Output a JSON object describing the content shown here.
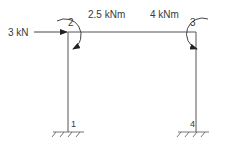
{
  "diagram": {
    "type": "portal-frame",
    "nodes": [
      {
        "id": "1",
        "label": "1",
        "x": 68,
        "y": 132,
        "support": "fixed"
      },
      {
        "id": "2",
        "label": "2",
        "x": 68,
        "y": 32
      },
      {
        "id": "3",
        "label": "3",
        "x": 196,
        "y": 32
      },
      {
        "id": "4",
        "label": "4",
        "x": 196,
        "y": 132,
        "support": "fixed"
      }
    ],
    "members": [
      {
        "from": "1",
        "to": "2"
      },
      {
        "from": "2",
        "to": "3"
      },
      {
        "from": "3",
        "to": "4"
      }
    ],
    "loads": {
      "horizontal_force": {
        "label": "3 kN",
        "node": "2",
        "direction": "right"
      },
      "moment_node2": {
        "label": "2.5 kNm",
        "node": "2",
        "direction": "clockwise"
      },
      "moment_node3": {
        "label": "4 kNm",
        "node": "3",
        "direction": "anticlockwise"
      }
    }
  },
  "colors": {
    "line": "#555555",
    "text": "#3a3a3a"
  }
}
